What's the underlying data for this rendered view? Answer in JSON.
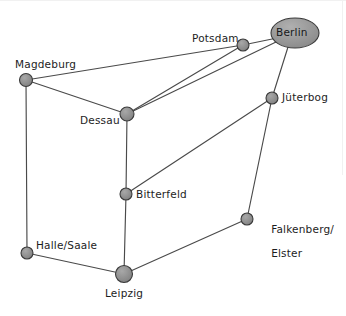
{
  "diagram": {
    "background_color": "#ffffff",
    "node_fill": "#8e8e8e",
    "node_stroke": "#3a3a3a",
    "edge_color": "#4a4a4a",
    "label_color": "#1d1d1d",
    "nodes": [
      {
        "id": "berlin",
        "label": "Berlin",
        "x": 295,
        "y": 33,
        "shape": "ellipse",
        "rx": 24,
        "ry": 15,
        "label_position": "inside"
      },
      {
        "id": "potsdam",
        "label": "Potsdam",
        "x": 243,
        "y": 45,
        "shape": "circle",
        "r": 6,
        "label_position": "left"
      },
      {
        "id": "magdeburg",
        "label": "Magdeburg",
        "x": 26,
        "y": 80,
        "shape": "circle",
        "r": 6.5,
        "label_position": "above-left"
      },
      {
        "id": "juterbog",
        "label": "Jüterbog",
        "x": 272,
        "y": 98,
        "shape": "circle",
        "r": 6,
        "label_position": "right"
      },
      {
        "id": "dessau",
        "label": "Dessau",
        "x": 127,
        "y": 114,
        "shape": "circle",
        "r": 7,
        "label_position": "left"
      },
      {
        "id": "bitterfeld",
        "label": "Bitterfeld",
        "x": 126,
        "y": 194,
        "shape": "circle",
        "r": 6,
        "label_position": "right"
      },
      {
        "id": "falkenberg",
        "label": "Falkenberg/\nElster",
        "x": 247,
        "y": 219,
        "shape": "circle",
        "r": 6,
        "label_position": "right"
      },
      {
        "id": "halle",
        "label": "Halle/Saale",
        "x": 27,
        "y": 253,
        "shape": "circle",
        "r": 6,
        "label_position": "right"
      },
      {
        "id": "leipzig",
        "label": "Leipzig",
        "x": 124,
        "y": 274,
        "shape": "circle",
        "r": 8.5,
        "label_position": "below"
      }
    ],
    "edges": [
      {
        "from": "magdeburg",
        "to": "potsdam"
      },
      {
        "from": "magdeburg",
        "to": "dessau"
      },
      {
        "from": "magdeburg",
        "to": "halle"
      },
      {
        "from": "potsdam",
        "to": "berlin"
      },
      {
        "from": "potsdam",
        "to": "dessau"
      },
      {
        "from": "dessau",
        "to": "berlin"
      },
      {
        "from": "dessau",
        "to": "bitterfeld"
      },
      {
        "from": "berlin",
        "to": "juterbog"
      },
      {
        "from": "juterbog",
        "to": "bitterfeld"
      },
      {
        "from": "juterbog",
        "to": "falkenberg"
      },
      {
        "from": "bitterfeld",
        "to": "leipzig"
      },
      {
        "from": "falkenberg",
        "to": "leipzig"
      },
      {
        "from": "halle",
        "to": "leipzig"
      }
    ],
    "labels": {
      "berlin": "Berlin",
      "potsdam": "Potsdam",
      "magdeburg": "Magdeburg",
      "juterbog": "Jüterbog",
      "dessau": "Dessau",
      "bitterfeld": "Bitterfeld",
      "falkenberg_line1": "Falkenberg/",
      "falkenberg_line2": "Elster",
      "halle": "Halle/Saale",
      "leipzig": "Leipzig"
    }
  }
}
